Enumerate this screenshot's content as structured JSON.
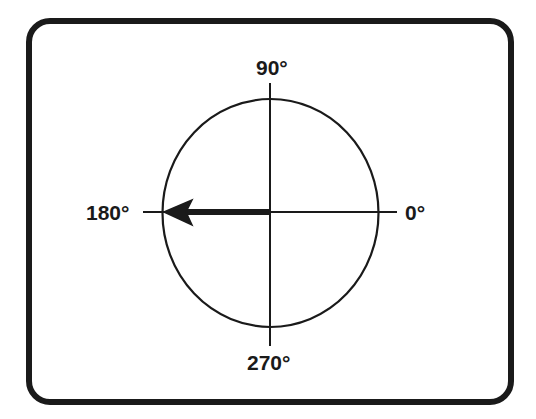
{
  "diagram": {
    "type": "phase-angle-compass",
    "labels": {
      "top": "90°",
      "right": "0°",
      "bottom": "270°",
      "left": "180°"
    },
    "arrow": {
      "direction_degrees": 180,
      "description": "Vector pointing toward 180°"
    },
    "colors": {
      "stroke": "#1a1a1a",
      "background": "#ffffff"
    }
  }
}
